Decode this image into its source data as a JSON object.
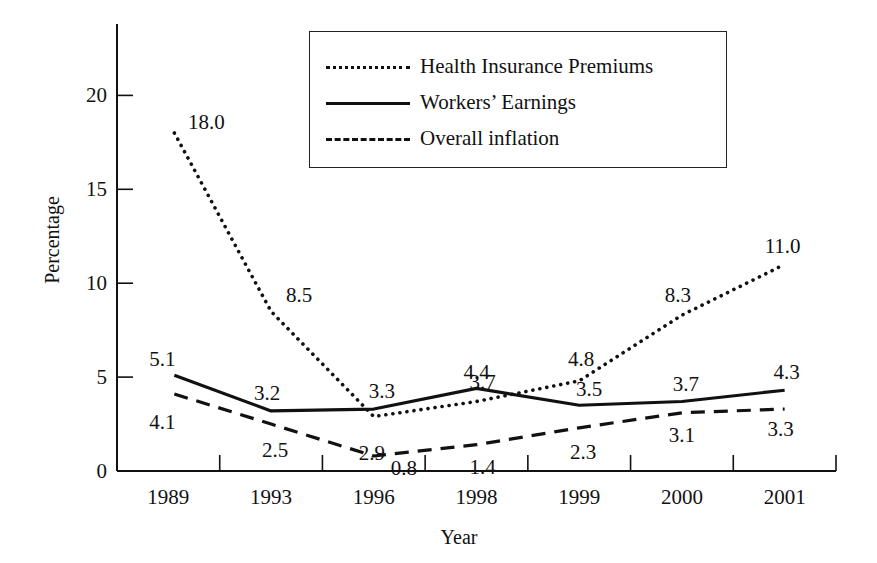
{
  "chart_data": {
    "type": "line",
    "title": "",
    "xlabel": "Year",
    "ylabel": "Percentage",
    "categories": [
      "1989",
      "1993",
      "1996",
      "1998",
      "1999",
      "2000",
      "2001"
    ],
    "ylim": [
      0,
      23
    ],
    "yticks": [
      0,
      5,
      10,
      15,
      20
    ],
    "grid": false,
    "legend_position": "upper right (inside)",
    "series": [
      {
        "name": "Health Insurance Premiums",
        "style": "dotted",
        "values": [
          18.0,
          8.5,
          2.9,
          3.7,
          4.8,
          8.3,
          11.0
        ]
      },
      {
        "name": "Workers’ Earnings",
        "style": "solid",
        "values": [
          5.1,
          3.2,
          3.3,
          4.4,
          3.5,
          3.7,
          4.3
        ]
      },
      {
        "name": "Overall inflation",
        "style": "dashed",
        "values": [
          4.1,
          2.5,
          0.8,
          1.4,
          2.3,
          3.1,
          3.3
        ]
      }
    ]
  },
  "legend": {
    "items": [
      {
        "label": "Health Insurance Premiums"
      },
      {
        "label": "Workers’ Earnings"
      },
      {
        "label": "Overall inflation"
      }
    ]
  },
  "axes": {
    "x_title": "Year",
    "y_title": "Percentage"
  },
  "colors": {
    "ink": "#111111",
    "background": "#ffffff"
  }
}
